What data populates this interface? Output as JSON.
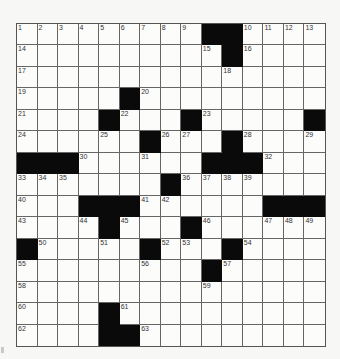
{
  "puzzle": {
    "size": {
      "rows": 15,
      "cols": 15
    },
    "colors": {
      "black": "#0a0a0a",
      "white": "#fcfcfb",
      "line": "#666666"
    },
    "grid": [
      [
        "1",
        "2",
        "3",
        "4",
        "5",
        "6",
        "7",
        "8",
        "9",
        "#",
        "#",
        "10",
        "11",
        "12",
        "13"
      ],
      [
        "14",
        "",
        "",
        "",
        "",
        "",
        "",
        "",
        "",
        "15",
        "#",
        "16",
        "",
        "",
        ""
      ],
      [
        "17",
        "",
        "",
        "",
        "",
        "",
        "",
        "",
        "",
        "",
        "18",
        "",
        "",
        "",
        ""
      ],
      [
        "19",
        "",
        "",
        "",
        "",
        "#",
        "20",
        "",
        "",
        "",
        "",
        "",
        "",
        "",
        ""
      ],
      [
        "21",
        "",
        "",
        "",
        "#",
        "22",
        "",
        "",
        "#",
        "23",
        "",
        "",
        "",
        "",
        "#"
      ],
      [
        "24",
        "",
        "",
        "",
        "25",
        "",
        "#",
        "26",
        "27",
        "",
        "#",
        "28",
        "",
        "",
        "29"
      ],
      [
        "#",
        "#",
        "#",
        "30",
        "",
        "",
        "31",
        "",
        "",
        "#",
        "#",
        "#",
        "32",
        "",
        ""
      ],
      [
        "33",
        "34",
        "35",
        "",
        "",
        "",
        "",
        "#",
        "36",
        "37",
        "38",
        "39",
        "",
        "",
        ""
      ],
      [
        "40",
        "",
        "",
        "#",
        "#",
        "#",
        "41",
        "42",
        "",
        "",
        "",
        "",
        "#",
        "#",
        "#"
      ],
      [
        "43",
        "",
        "",
        "44",
        "#",
        "45",
        "",
        "",
        "#",
        "46",
        "",
        "",
        "47",
        "48",
        "49"
      ],
      [
        "#",
        "50",
        "",
        "",
        "51",
        "",
        "#",
        "52",
        "53",
        "",
        "#",
        "54",
        "",
        "",
        ""
      ],
      [
        "55",
        "",
        "",
        "",
        "",
        "",
        "56",
        "",
        "",
        "#",
        "57",
        "",
        "",
        "",
        ""
      ],
      [
        "58",
        "",
        "",
        "",
        "",
        "",
        "",
        "",
        "",
        "59",
        "",
        "",
        "",
        "",
        ""
      ],
      [
        "60",
        "",
        "",
        "",
        "#",
        "61",
        "",
        "",
        "",
        "",
        "",
        "",
        "",
        "",
        ""
      ],
      [
        "62",
        "",
        "",
        "",
        "#",
        "#",
        "63",
        "",
        "",
        "",
        "",
        "",
        "",
        "",
        ""
      ]
    ]
  }
}
